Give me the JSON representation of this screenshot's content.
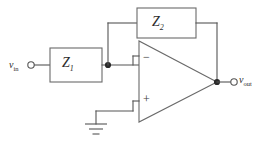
{
  "diagram": {
    "colors": {
      "wire": "#555555",
      "box_stroke": "#6a6a6a",
      "node": "#2b2b2b",
      "background": "#ffffff",
      "text": "#2b2b2b"
    },
    "components": {
      "input_impedance": {
        "label": "Z",
        "subscript": "1"
      },
      "feedback_impedance": {
        "label": "Z",
        "subscript": "2"
      },
      "opamp": {
        "inverting_terminal": "−",
        "noninverting_terminal": "+"
      }
    },
    "terminals": {
      "input": {
        "label": "v",
        "subscript": "in"
      },
      "output": {
        "label": "v",
        "subscript": "out"
      }
    },
    "ground": {
      "name": "ground-symbol"
    }
  }
}
